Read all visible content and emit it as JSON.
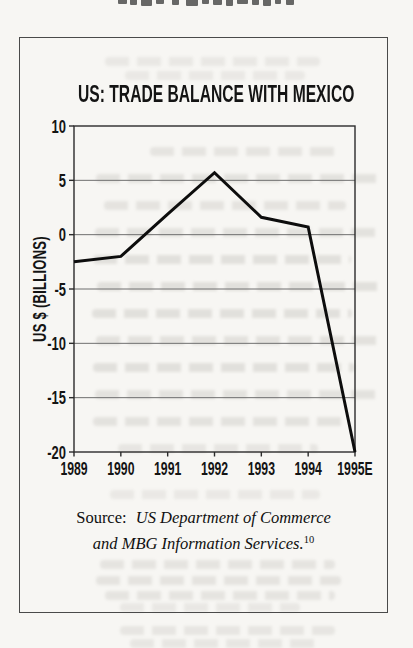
{
  "chart_data": {
    "type": "line",
    "title": "US: TRADE BALANCE WITH MEXICO",
    "xlabel": "",
    "ylabel": "US $ (BILLIONS)",
    "categories": [
      "1989",
      "1990",
      "1991",
      "1992",
      "1993",
      "1994",
      "1995E"
    ],
    "values": [
      -2.5,
      -2,
      1.9,
      5.7,
      1.6,
      0.7,
      -20
    ],
    "ylim": [
      -20,
      10
    ],
    "yticks": [
      10,
      5,
      0,
      -5,
      -10,
      -15,
      -20
    ],
    "grid": true,
    "legend": "none",
    "line_color": "#0d0d0d"
  },
  "source": {
    "label": "Source:",
    "line1": "US Department of Commerce",
    "line2": "and MBG Information Services.",
    "footnote_marker": "10"
  },
  "colors": {
    "paper": "#f7f6f3",
    "box_border": "#4a4a4a",
    "grid": "#6f6f6f",
    "axis": "#2b2b2b",
    "text": "#141414"
  }
}
